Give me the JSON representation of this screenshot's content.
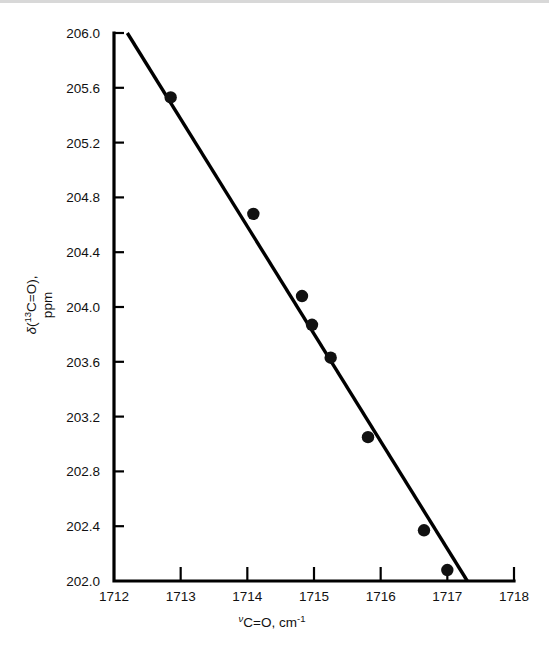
{
  "figure": {
    "background_color": "#ffffff",
    "ink_color": "#111111"
  },
  "chart_data": {
    "type": "scatter",
    "title": "",
    "subtitle": "",
    "xlabel": "νC=O, cm⁻¹",
    "xlabel_parts": {
      "symbol": "ν",
      "body": "C=O, cm",
      "exponent": "-1"
    },
    "ylabel": "δ(¹³C=O), ppm",
    "ylabel_lines": [
      "δ(¹³C=O),",
      "ppm"
    ],
    "ylabel_parts": {
      "symbol": "δ",
      "open": "(",
      "isotope": "13",
      "body": "C=O),",
      "units": "ppm"
    },
    "xlim": [
      1712,
      1718
    ],
    "ylim": [
      202.0,
      206.0
    ],
    "xticks": [
      1712,
      1713,
      1714,
      1715,
      1716,
      1717,
      1718
    ],
    "xtick_labels": [
      "1712",
      "1713",
      "1714",
      "1715",
      "1716",
      "1717",
      "1718"
    ],
    "yticks": [
      202.0,
      202.4,
      202.8,
      203.2,
      203.6,
      204.0,
      204.4,
      204.8,
      205.2,
      205.6,
      206.0
    ],
    "ytick_labels": [
      "202.0",
      "202.4",
      "202.8",
      "203.2",
      "203.6",
      "204.0",
      "204.4",
      "204.8",
      "205.2",
      "205.6",
      "206.0"
    ],
    "grid": false,
    "legend": false,
    "legend_position": "none",
    "marker": "filled-circle",
    "x": [
      1712.85,
      1714.09,
      1714.82,
      1714.97,
      1715.25,
      1715.81,
      1716.65,
      1717.0
    ],
    "y": [
      205.53,
      204.68,
      204.08,
      203.87,
      203.63,
      203.05,
      202.37,
      202.08
    ],
    "points": [
      {
        "x": 1712.85,
        "y": 205.53
      },
      {
        "x": 1714.09,
        "y": 204.68
      },
      {
        "x": 1714.82,
        "y": 204.08
      },
      {
        "x": 1714.97,
        "y": 203.87
      },
      {
        "x": 1715.25,
        "y": 203.63
      },
      {
        "x": 1715.81,
        "y": 203.05
      },
      {
        "x": 1716.65,
        "y": 202.37
      },
      {
        "x": 1717.0,
        "y": 202.08
      }
    ],
    "fit_line": {
      "type": "line",
      "x": [
        1712.2,
        1717.3
      ],
      "y": [
        206.0,
        202.0
      ]
    }
  }
}
